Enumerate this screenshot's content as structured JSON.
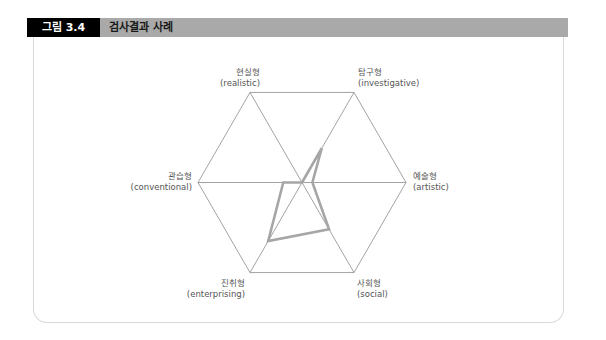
{
  "header": {
    "figure_number": "그림 3.4",
    "title": "검사결과 사례"
  },
  "axes": [
    {
      "key": "realistic",
      "ko": "현실형",
      "en": "(realistic)"
    },
    {
      "key": "investigative",
      "ko": "탐구형",
      "en": "(investigative)"
    },
    {
      "key": "artistic",
      "ko": "예술형",
      "en": "(artistic)"
    },
    {
      "key": "social",
      "ko": "사회형",
      "en": "(social)"
    },
    {
      "key": "enterprising",
      "ko": "진취형",
      "en": "(enterprising)"
    },
    {
      "key": "conventional",
      "ko": "관습형",
      "en": "(conventional)"
    }
  ],
  "colors": {
    "grid": "#8c8c8c",
    "series": "#a6a6a6",
    "header_bar": "#a9a9a9",
    "figure_tag": "#000000"
  },
  "chart_data": {
    "type": "radar",
    "title": "검사결과 사례",
    "categories": [
      "현실형 (realistic)",
      "탐구형 (investigative)",
      "예술형 (artistic)",
      "사회형 (social)",
      "진취형 (enterprising)",
      "관습형 (conventional)"
    ],
    "series": [
      {
        "name": "검사결과",
        "values": [
          0.0,
          0.38,
          0.1,
          0.52,
          0.65,
          0.18
        ]
      }
    ],
    "range": [
      0,
      1
    ],
    "grid": "hexagon outline with three diagonals through center",
    "legend": "none"
  }
}
